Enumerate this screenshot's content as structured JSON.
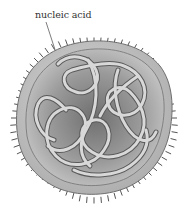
{
  "diagram": {
    "labels": [
      {
        "text": "nucleic acid",
        "target": "coiled strand inside particle"
      }
    ],
    "colors": {
      "background": "#ffffff",
      "outer_membrane": "#bdbdbd",
      "membrane_outline": "#6e6e6e",
      "inner_core_light": "#c8c8c8",
      "inner_core_dark": "#7a7a7a",
      "strand_fill": "#d9d9d9",
      "strand_outline": "#5a5a5a",
      "spikes": "#555555",
      "label_text": "#333333"
    }
  }
}
